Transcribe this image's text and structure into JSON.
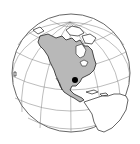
{
  "map": {
    "projection": "orthographic",
    "region_highlighted": "North America",
    "marker_location": "South Texas",
    "colors": {
      "background": "#ffffff",
      "globe_fill": "#ffffff",
      "highlight_fill": "#b8b8b8",
      "outline": "#222222",
      "graticule": "#7a7a7a",
      "marker": "#000000"
    }
  }
}
